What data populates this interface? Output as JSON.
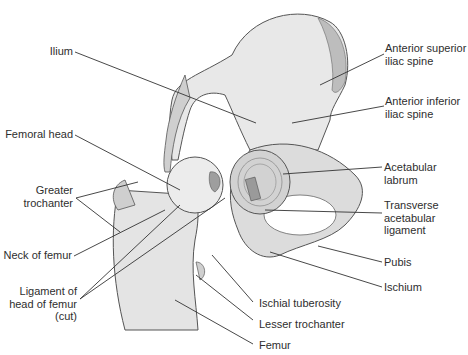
{
  "figure": {
    "colors": {
      "bone": "#e6e6e6",
      "bone_shade": "#b8b8b8",
      "outline": "#555555",
      "leader": "#333333",
      "text": "#2e2e2e"
    }
  },
  "labels": {
    "ilium": "Ilium",
    "femoral_head": "Femoral head",
    "greater_trochanter": "Greater\ntrochanter",
    "neck_of_femur": "Neck of femur",
    "ligament_head_femur": "Ligament of\nhead of femur\n(cut)",
    "asis": "Anterior superior\niliac spine",
    "aiis": "Anterior inferior\niliac spine",
    "acetabular_labrum": "Acetabular\nlabrum",
    "transverse_acetabular_ligament": "Transverse\nacetabular\nligament",
    "pubis": "Pubis",
    "ischium": "Ischium",
    "ischial_tuberosity": "Ischial tuberosity",
    "lesser_trochanter": "Lesser trochanter",
    "femur": "Femur"
  }
}
